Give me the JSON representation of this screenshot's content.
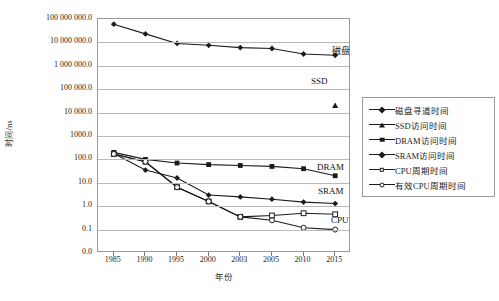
{
  "chart_data": {
    "type": "line",
    "title": "",
    "xlabel": "年份",
    "ylabel": "时间/ns",
    "grid": true,
    "legend_position": "right",
    "y_scale": "log",
    "categories": [
      "1985",
      "1990",
      "1995",
      "2000",
      "2003",
      "2005",
      "2010",
      "2015"
    ],
    "ytick_labels": [
      "100 000 000.0",
      "10 000 000.0",
      "1 000 000.0",
      "100 000.0",
      "10 000.0",
      "1000.0",
      "100.0",
      "10.0",
      "1.0",
      "0.1",
      "0.0"
    ],
    "ytick_values": [
      100000000,
      10000000,
      1000000,
      100000,
      10000,
      1000,
      100,
      10,
      1,
      0.1,
      0
    ],
    "ylim": [
      0.0,
      100000000.0
    ],
    "series": [
      {
        "name": "磁盘寻道时间",
        "marker": "filled-diamond",
        "values": [
          60000000,
          23000000,
          9000000,
          7500000,
          6000000,
          5500000,
          3200000,
          2800000
        ]
      },
      {
        "name": "SSD访问时间",
        "marker": "filled-triangle",
        "values": [
          null,
          null,
          null,
          null,
          null,
          null,
          null,
          20000
        ]
      },
      {
        "name": "DRAM访问时间",
        "marker": "filled-square",
        "values": [
          200,
          100,
          70,
          60,
          55,
          50,
          40,
          20
        ]
      },
      {
        "name": "SRAM访问时间",
        "marker": "filled-diamond",
        "values": [
          180,
          35,
          16,
          3,
          2.5,
          2,
          1.5,
          1.3
        ]
      },
      {
        "name": "CPU周期时间",
        "marker": "open-square",
        "values": [
          170,
          80,
          6.5,
          1.6,
          0.35,
          0.4,
          0.5,
          0.45
        ]
      },
      {
        "name": "有效CPU周期时间",
        "marker": "open-circle",
        "values": [
          170,
          80,
          6.5,
          1.6,
          0.35,
          0.25,
          0.12,
          0.1
        ]
      }
    ],
    "annotations": [
      {
        "text": "磁盘",
        "name": "disk-label"
      },
      {
        "text": "SSD",
        "name": "ssd-label"
      },
      {
        "text": "DRAM",
        "name": "dram-label"
      },
      {
        "text": "SRAM",
        "name": "sram-label"
      },
      {
        "text": "CPU",
        "name": "cpu-label"
      }
    ],
    "colors": {
      "line": "#1b1b1b",
      "grid": "#b9b9b9",
      "frame": "#9a9a9a"
    }
  },
  "legend": {
    "items": [
      {
        "label": "磁盘寻道时间",
        "marker": "filled-diamond"
      },
      {
        "label": "SSD访问时间",
        "marker": "filled-triangle"
      },
      {
        "label": "DRAM访问时间",
        "marker": "filled-square"
      },
      {
        "label": "SRAM访问时间",
        "marker": "filled-diamond"
      },
      {
        "label": "CPU周期时间",
        "marker": "open-square"
      },
      {
        "label": "有效CPU周期时间",
        "marker": "open-circle"
      }
    ]
  }
}
